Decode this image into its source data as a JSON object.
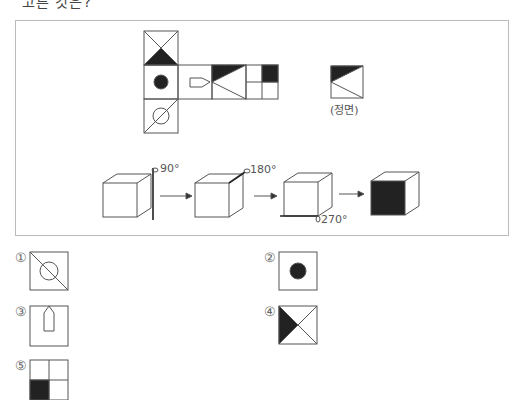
{
  "question": {
    "clipped_prompt": "고른 것은?"
  },
  "figure": {
    "net_description": "cube net with 6 faces",
    "front_view_label": "(정면)",
    "rotations": [
      {
        "angle_label": "90°",
        "axis": "vertical right edge"
      },
      {
        "angle_label": "180°",
        "axis": "top right edge"
      },
      {
        "angle_label": "270°",
        "axis": "bottom front edge"
      }
    ],
    "result_description": "final cube with black front face"
  },
  "options": [
    {
      "number": "①",
      "description": "square with diagonal and circle"
    },
    {
      "number": "②",
      "description": "square with black dot"
    },
    {
      "number": "③",
      "description": "square with pentagon arrow shape"
    },
    {
      "number": "④",
      "description": "square with X and black left triangle"
    },
    {
      "number": "⑤",
      "description": "2x2 grid with bottom-left black"
    }
  ]
}
